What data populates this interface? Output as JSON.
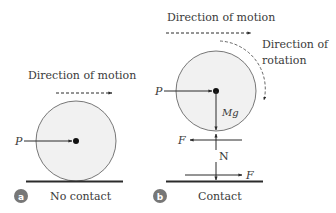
{
  "colors": {
    "line": "#2b2b2b",
    "circle_fill": "#f1f1f1",
    "circle_stroke": "#555555",
    "badge": "#777777",
    "text": "#3a3a3a"
  },
  "panel_a": {
    "badge": "a",
    "caption": "No contact",
    "motion_label": "Direction of motion",
    "force_p": "P"
  },
  "panel_b": {
    "badge": "b",
    "caption": "Contact",
    "motion_label": "Direction of motion",
    "rotation_label_line1": "Direction of",
    "rotation_label_line2": "rotation",
    "force_p": "P",
    "weight": "Mg",
    "friction_top": "F",
    "normal": "N",
    "friction_bottom": "F"
  }
}
